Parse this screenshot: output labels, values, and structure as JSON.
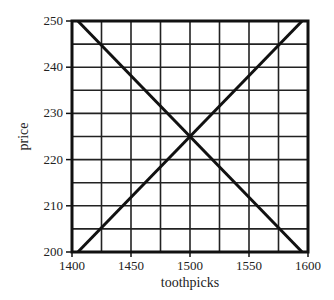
{
  "chart_data": {
    "type": "line",
    "title": "",
    "xlabel": "toothpicks",
    "ylabel": "price",
    "xlim": [
      1400,
      1600
    ],
    "ylim": [
      200,
      250
    ],
    "xticks": [
      1400,
      1450,
      1500,
      1550,
      1600
    ],
    "yticks": [
      200,
      210,
      220,
      230,
      240,
      250
    ],
    "x_grid_step": 25,
    "y_grid_step": 5,
    "grid": true,
    "legend": null,
    "series": [
      {
        "name": "demand",
        "x": [
          1405,
          1595
        ],
        "y": [
          250,
          200
        ],
        "color": "#111111"
      },
      {
        "name": "supply",
        "x": [
          1405,
          1595
        ],
        "y": [
          200,
          250
        ],
        "color": "#111111"
      }
    ],
    "annotations": [
      {
        "type": "intersection",
        "x": 1500,
        "y": 225
      }
    ]
  },
  "colors": {
    "grid": "#222222",
    "axis": "#111111",
    "line": "#111111",
    "background": "#ffffff"
  }
}
